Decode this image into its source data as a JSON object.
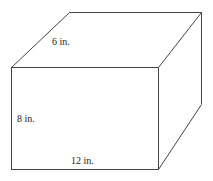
{
  "figure": {
    "shape": "rectangular prism",
    "line_color": "#444444",
    "background": "#ffffff",
    "labels": {
      "depth": "6 in.",
      "height": "8 in.",
      "length": "12 in."
    },
    "dimensions": {
      "length_in": 12,
      "height_in": 8,
      "depth_in": 6
    }
  }
}
